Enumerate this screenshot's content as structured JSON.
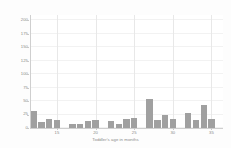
{
  "chart_data": {
    "type": "bar",
    "title": "",
    "subtitle": "",
    "xlabel": "Toddler's age in months",
    "ylabel": "",
    "xlim": [
      11.5,
      36.5
    ],
    "ylim": [
      0,
      210
    ],
    "grid": true,
    "legend": null,
    "legend_position": "none",
    "bar_color": "#a0a0a0",
    "x_tick_labels": [
      "15",
      "20",
      "25",
      "30",
      "35"
    ],
    "x_ticks": [
      15,
      20,
      25,
      30,
      35
    ],
    "y_tick_labels": [
      "0",
      "25",
      "50",
      "75",
      "100",
      "125",
      "150",
      "175",
      "200"
    ],
    "y_ticks": [
      0,
      25,
      50,
      75,
      100,
      125,
      150,
      175,
      200
    ],
    "categories": [
      12,
      13,
      14,
      15,
      16,
      17,
      18,
      19,
      20,
      21,
      22,
      23,
      24,
      25,
      26,
      27,
      28,
      29,
      30,
      31,
      32,
      33,
      34,
      35,
      36
    ],
    "values": [
      32,
      12,
      16,
      14,
      0,
      7,
      8,
      13,
      14,
      0,
      13,
      8,
      16,
      18,
      0,
      54,
      15,
      25,
      16,
      0,
      27,
      14,
      43,
      16,
      0
    ],
    "values_note": "bar heights read from y-axis in counts"
  },
  "axis": {
    "x_title": "Toddler's age in months"
  }
}
